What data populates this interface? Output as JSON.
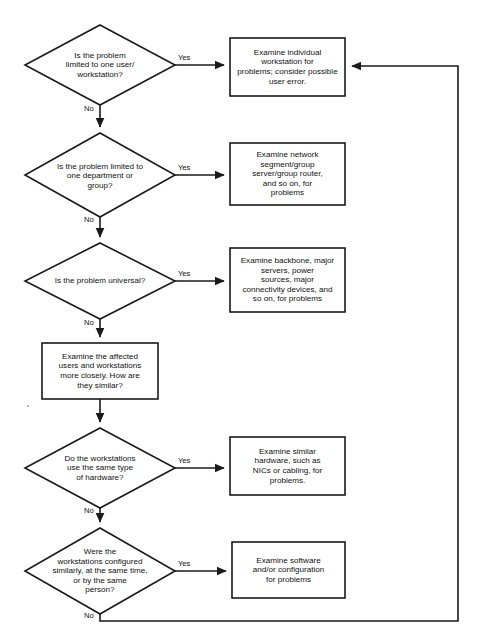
{
  "diagram": {
    "background_color": "#ffffff",
    "line_color": "#1a1a1a",
    "text_color": "#111111",
    "decisions": [
      {
        "id": "d1",
        "text": "Is the problem\nlimited to one user/\nworkstation?",
        "yes_label": "Yes",
        "no_label": "No"
      },
      {
        "id": "d2",
        "text": "Is the problem limited to\none department or\ngroup?",
        "yes_label": "Yes",
        "no_label": "No"
      },
      {
        "id": "d3",
        "text": "Is the problem universal?",
        "yes_label": "Yes",
        "no_label": "No"
      },
      {
        "id": "d4",
        "text": "Do the workstations\nuse the same type\nof hardware?",
        "yes_label": "Yes",
        "no_label": "No"
      },
      {
        "id": "d5",
        "text": "Were the\nworkstations configured\nsimilarly, at the same time,\nor by the same\nperson?",
        "yes_label": "Yes",
        "no_label": "No"
      }
    ],
    "processes": [
      {
        "id": "p1",
        "text": "Examine individual\nworkstation for\nproblems; consider possible\nuser error."
      },
      {
        "id": "p2",
        "text": "Examine network\nsegment/group\nserver/group router,\nand so on, for\nproblems"
      },
      {
        "id": "p3",
        "text": "Examine backbone, major\nservers, power\nsources, major\nconnectivity devices, and\nso on, for problems"
      },
      {
        "id": "p4",
        "text": "Examine the affected\nusers and workstations\nmore closely. How are\nthey similar?"
      },
      {
        "id": "p5",
        "text": "Examine similar\nhardware, such as\nNICs or cabling, for\nproblems."
      },
      {
        "id": "p6",
        "text": "Examine software\nand/or configuration\nfor problems"
      }
    ]
  }
}
